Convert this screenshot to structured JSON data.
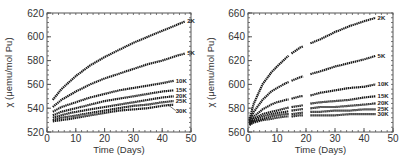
{
  "chart_data": [
    {
      "type": "line",
      "panel": "left",
      "title": "",
      "xlabel": "Time (Days)",
      "ylabel": "χ (μemu/mol Pu)",
      "xlim": [
        0,
        50
      ],
      "ylim": [
        520,
        620
      ],
      "xticks": [
        0,
        10,
        20,
        30,
        40,
        50
      ],
      "yticks": [
        520,
        540,
        560,
        580,
        600,
        620
      ],
      "grid": false,
      "legend": "inline-right",
      "series": [
        {
          "name": "2K",
          "label": "2K",
          "x": [
            2,
            5,
            10,
            15,
            20,
            25,
            30,
            35,
            40,
            45,
            48
          ],
          "y": [
            547,
            556,
            567,
            576,
            583,
            589,
            595,
            600,
            605,
            610,
            613
          ]
        },
        {
          "name": "5K",
          "label": "5K",
          "x": [
            2,
            5,
            10,
            15,
            20,
            25,
            30,
            35,
            40,
            45,
            48
          ],
          "y": [
            541,
            547,
            554,
            560,
            565,
            569,
            573,
            577,
            580,
            584,
            586
          ]
        },
        {
          "name": "10K",
          "label": "10K",
          "x": [
            2,
            5,
            10,
            15,
            20,
            25,
            30,
            35,
            40,
            44
          ],
          "y": [
            537,
            541,
            545,
            549,
            552,
            555,
            557,
            559,
            561,
            563
          ]
        },
        {
          "name": "15K",
          "label": "15K",
          "x": [
            2,
            5,
            10,
            15,
            20,
            25,
            30,
            35,
            40,
            44
          ],
          "y": [
            534,
            537,
            540,
            543,
            546,
            548,
            550,
            552,
            554,
            555
          ]
        },
        {
          "name": "20K",
          "label": "20K",
          "x": [
            2,
            5,
            8,
            15,
            20,
            25,
            30,
            35,
            40,
            44
          ],
          "y": [
            532,
            534,
            536,
            539,
            541,
            543,
            545,
            547,
            549,
            550
          ]
        },
        {
          "name": "25K",
          "label": "25K",
          "x": [
            2,
            5,
            8,
            15,
            20,
            25,
            30,
            35,
            40,
            44
          ],
          "y": [
            530,
            532,
            533,
            536,
            538,
            540,
            542,
            543,
            545,
            546
          ]
        },
        {
          "name": "30K",
          "label": "30K",
          "x": [
            2,
            5,
            8,
            15,
            20,
            25,
            30,
            35,
            40,
            44
          ],
          "y": [
            529,
            530,
            531,
            534,
            536,
            538,
            539,
            540,
            542,
            543
          ]
        }
      ]
    },
    {
      "type": "line",
      "panel": "right",
      "title": "",
      "xlabel": "Time (Days)",
      "ylabel": "χ (μemu/mol Pu)",
      "xlim": [
        0,
        50
      ],
      "ylim": [
        560,
        660
      ],
      "xticks": [
        0,
        10,
        20,
        30,
        40,
        50
      ],
      "yticks": [
        560,
        580,
        600,
        620,
        640,
        660
      ],
      "grid": false,
      "legend": "inline-right",
      "series": [
        {
          "name": "2K",
          "label": "2K",
          "x": [
            0.5,
            2,
            5,
            8,
            10,
            13,
            15,
            18,
            22,
            25,
            30,
            35,
            40,
            44
          ],
          "y": [
            570,
            584,
            600,
            610,
            615,
            622,
            626,
            631,
            635,
            638,
            644,
            649,
            653,
            656
          ]
        },
        {
          "name": "5K",
          "label": "5K",
          "x": [
            0.5,
            2,
            5,
            8,
            10,
            13,
            15,
            18,
            22,
            25,
            30,
            35,
            40,
            44
          ],
          "y": [
            569,
            577,
            587,
            594,
            597,
            601,
            603,
            606,
            609,
            611,
            615,
            618,
            621,
            624
          ]
        },
        {
          "name": "10K",
          "label": "10K",
          "x": [
            0.5,
            2,
            5,
            8,
            10,
            13,
            15,
            18,
            22,
            25,
            30,
            35,
            40,
            44
          ],
          "y": [
            568,
            573,
            579,
            583,
            585,
            587,
            588,
            590,
            591,
            593,
            595,
            597,
            598,
            600
          ]
        },
        {
          "name": "15K",
          "label": "15K",
          "x": [
            0.5,
            2,
            5,
            8,
            10,
            13,
            15,
            18,
            22,
            25,
            30,
            35,
            40,
            44
          ],
          "y": [
            567,
            571,
            575,
            577,
            578,
            580,
            581,
            582,
            584,
            585,
            586,
            587,
            589,
            590
          ]
        },
        {
          "name": "20K",
          "label": "20K",
          "x": [
            0.5,
            2,
            5,
            8,
            10,
            13,
            15,
            18,
            22,
            25,
            30,
            35,
            40,
            44
          ],
          "y": [
            567,
            570,
            573,
            575,
            576,
            577,
            578,
            579,
            580,
            581,
            581,
            582,
            583,
            584
          ]
        },
        {
          "name": "25K",
          "label": "25K",
          "x": [
            0.5,
            2,
            5,
            8,
            10,
            13,
            15,
            18,
            22,
            25,
            30,
            35,
            40,
            44
          ],
          "y": [
            566,
            569,
            571,
            573,
            574,
            575,
            575,
            576,
            577,
            577,
            578,
            578,
            579,
            579
          ]
        },
        {
          "name": "30K",
          "label": "30K",
          "x": [
            0.5,
            2,
            5,
            8,
            10,
            13,
            15,
            18,
            22,
            25,
            30,
            35,
            40,
            44
          ],
          "y": [
            566,
            568,
            570,
            571,
            572,
            573,
            573,
            574,
            574,
            574,
            574,
            575,
            575,
            575
          ]
        }
      ],
      "gaps_days": [
        [
          14,
          15
        ],
        [
          19,
          21.5
        ]
      ]
    }
  ],
  "colors": {
    "axis": "#555555",
    "curve": "#1a1a1a",
    "text": "#333333"
  }
}
